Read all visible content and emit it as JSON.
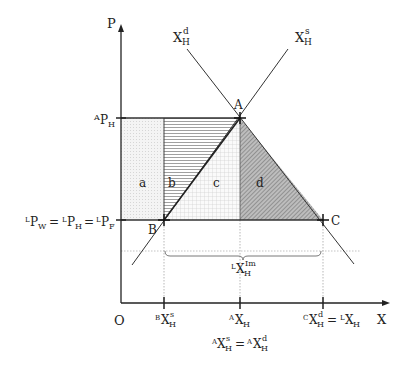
{
  "axes": {
    "y_label": "P",
    "x_label": "X",
    "origin_label": "O"
  },
  "curves": {
    "demand": {
      "base": "X",
      "sup": "d",
      "sub": "H"
    },
    "supply": {
      "base": "X",
      "sup": "s",
      "sub": "H"
    }
  },
  "points": {
    "A": "A",
    "B": "B",
    "C": "C"
  },
  "y_ticks": {
    "autarky_price": {
      "pre": "A",
      "base": "P",
      "sub": "H"
    },
    "world_price": {
      "text": "ᴸP_W = ᴸP_H = ᴸP_F",
      "parts": [
        {
          "pre": "L",
          "base": "P",
          "sub": "W"
        },
        {
          "pre": "L",
          "base": "P",
          "sub": "H"
        },
        {
          "pre": "L",
          "base": "P",
          "sub": "F"
        }
      ]
    }
  },
  "x_ticks": {
    "B_supply": {
      "pre": "B",
      "base": "X",
      "sup": "s",
      "sub": "H"
    },
    "A_quantity": {
      "pre": "A",
      "base": "X",
      "sub": "H"
    },
    "A_equality": {
      "text": "ᴬX^s_H = ᴬX^d_H"
    },
    "C_demand": {
      "text": "ᶜX^d_H = ᴸX_H"
    }
  },
  "imports_label": {
    "pre": "L",
    "base": "X",
    "sup": "Im",
    "sub": "H"
  },
  "areas": [
    "a",
    "b",
    "c",
    "d"
  ],
  "colors": {
    "line": "#222222",
    "guide": "#999999",
    "area_d": "#777777"
  }
}
